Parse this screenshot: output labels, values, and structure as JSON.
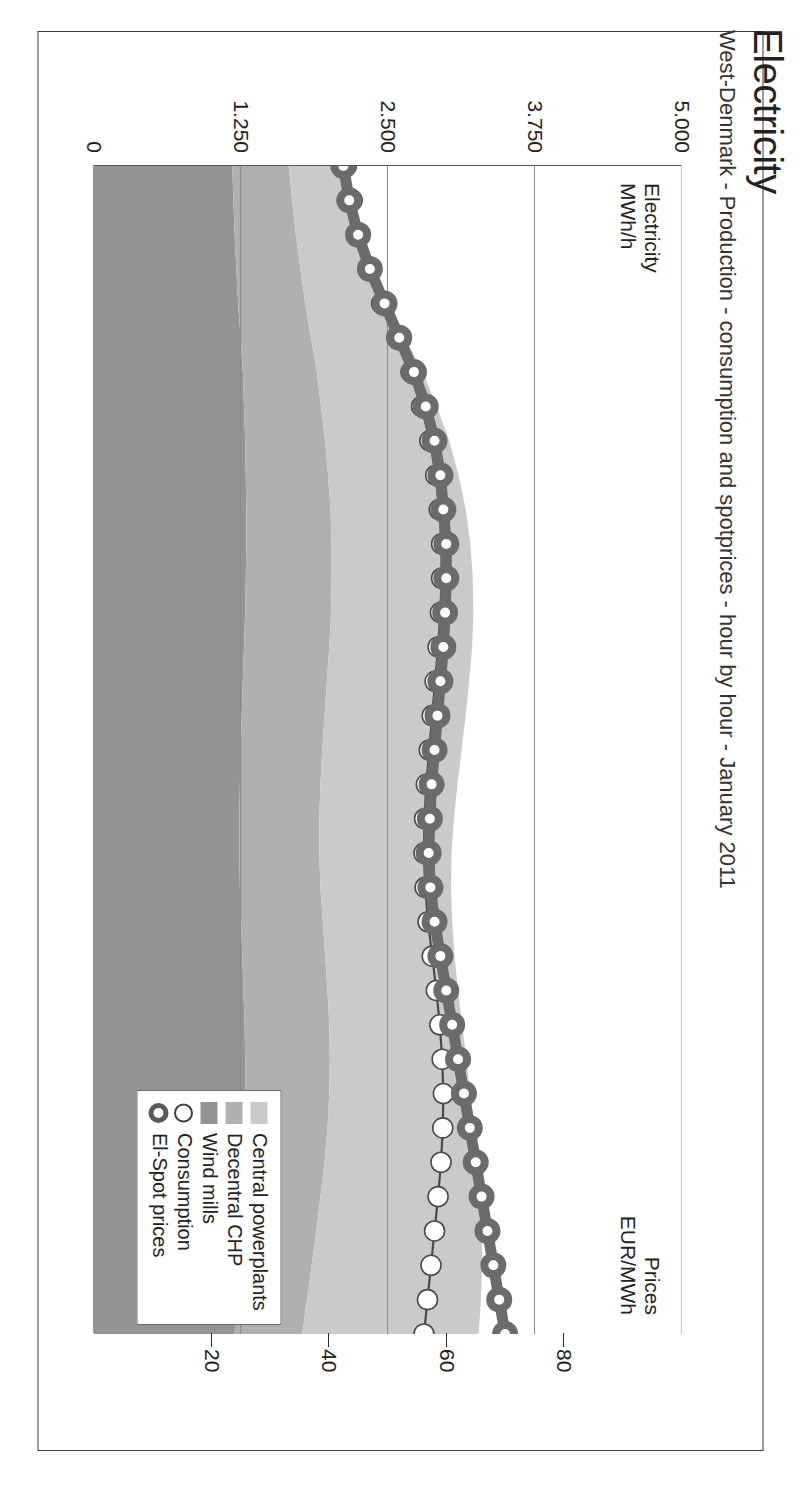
{
  "header": {
    "title": "Electricity",
    "subtitle": "West-Denmark - Production - consumption and spotprices - hour by hour - January 2011"
  },
  "axis_labels": {
    "left": "Electricity\nMWh/h",
    "right": "Prices\nEUR/MWh"
  },
  "legend": {
    "items": [
      {
        "label": "Central powerplants",
        "type": "swatch",
        "color": "#cacaca"
      },
      {
        "label": "Decentral CHP",
        "type": "swatch",
        "color": "#b0b0b0"
      },
      {
        "label": "Wind mills",
        "type": "swatch",
        "color": "#949494"
      },
      {
        "label": "Consumption",
        "type": "circle-open",
        "color": "#ffffff",
        "ring": "#3f3f3f"
      },
      {
        "label": "El-Spot prices",
        "type": "circle-ring",
        "color": "#ffffff",
        "ring": "#595959"
      }
    ]
  },
  "chart_data": {
    "type": "area",
    "title": "Electricity",
    "subtitle": "West-Denmark - Production - consumption and spotprices - hour by hour - January 2011",
    "xlabel": "",
    "ylabel": "Electricity MWh/h",
    "y2label": "Prices EUR/MWh",
    "ylim": [
      0,
      5000
    ],
    "yticks": [
      0,
      1250,
      2500,
      3750,
      5000
    ],
    "ytick_labels": [
      "0",
      "1.250",
      "2.500",
      "3.750",
      "5.000"
    ],
    "y2lim": [
      0,
      100
    ],
    "y2ticks": [
      20,
      40,
      60,
      80
    ],
    "y2tick_labels": [
      "20",
      "40",
      "60",
      "80"
    ],
    "grid": true,
    "legend_position": "bottom-right",
    "x": [
      1,
      2,
      3,
      4,
      5,
      6,
      7,
      8,
      9,
      10,
      11,
      12,
      13,
      14,
      15,
      16,
      17,
      18,
      19,
      20,
      21,
      22,
      23,
      24,
      25,
      26,
      27,
      28,
      29,
      30,
      31,
      32,
      33,
      34,
      35
    ],
    "stacked_series": [
      {
        "name": "Wind mills",
        "color": "#949494",
        "values": [
          1180,
          1190,
          1200,
          1215,
          1230,
          1250,
          1270,
          1280,
          1290,
          1295,
          1300,
          1300,
          1295,
          1290,
          1280,
          1270,
          1260,
          1250,
          1245,
          1240,
          1240,
          1245,
          1255,
          1265,
          1275,
          1285,
          1290,
          1290,
          1285,
          1275,
          1260,
          1245,
          1230,
          1215,
          1200
        ]
      },
      {
        "name": "Decentral CHP",
        "color": "#b0b0b0",
        "values": [
          480,
          500,
          520,
          545,
          570,
          600,
          630,
          655,
          680,
          700,
          715,
          725,
          730,
          730,
          725,
          715,
          705,
          695,
          685,
          680,
          680,
          685,
          695,
          705,
          715,
          720,
          720,
          715,
          705,
          690,
          670,
          650,
          625,
          600,
          575
        ]
      },
      {
        "name": "Central powerplants",
        "color": "#cacaca",
        "values": [
          430,
          470,
          530,
          610,
          700,
          800,
          900,
          985,
          1055,
          1110,
          1150,
          1180,
          1200,
          1210,
          1215,
          1210,
          1200,
          1185,
          1165,
          1145,
          1125,
          1110,
          1100,
          1100,
          1110,
          1130,
          1160,
          1200,
          1250,
          1305,
          1360,
          1410,
          1450,
          1480,
          1500
        ]
      }
    ],
    "line_series": [
      {
        "name": "Consumption",
        "marker": "circle-open",
        "color": "#ffffff",
        "line": "#4a4a4a",
        "axis": "left",
        "values": [
          2150,
          2200,
          2260,
          2340,
          2450,
          2580,
          2700,
          2790,
          2860,
          2910,
          2940,
          2960,
          2960,
          2950,
          2930,
          2905,
          2880,
          2855,
          2830,
          2815,
          2810,
          2820,
          2845,
          2880,
          2915,
          2945,
          2965,
          2975,
          2970,
          2955,
          2930,
          2900,
          2870,
          2840,
          2810
        ]
      },
      {
        "name": "El-Spot prices",
        "marker": "circle-ring",
        "color": "#ffffff",
        "line": "#6b6b6b",
        "axis": "right",
        "values": [
          42.5,
          43.5,
          45.0,
          47.0,
          49.5,
          52.0,
          54.5,
          56.5,
          58.0,
          59.0,
          59.5,
          60.0,
          60.0,
          59.8,
          59.5,
          59.0,
          58.5,
          58.0,
          57.5,
          57.2,
          57.0,
          57.3,
          58.0,
          59.0,
          60.0,
          61.0,
          62.0,
          63.0,
          64.0,
          65.0,
          66.0,
          67.0,
          68.0,
          69.0,
          70.0
        ]
      }
    ]
  }
}
